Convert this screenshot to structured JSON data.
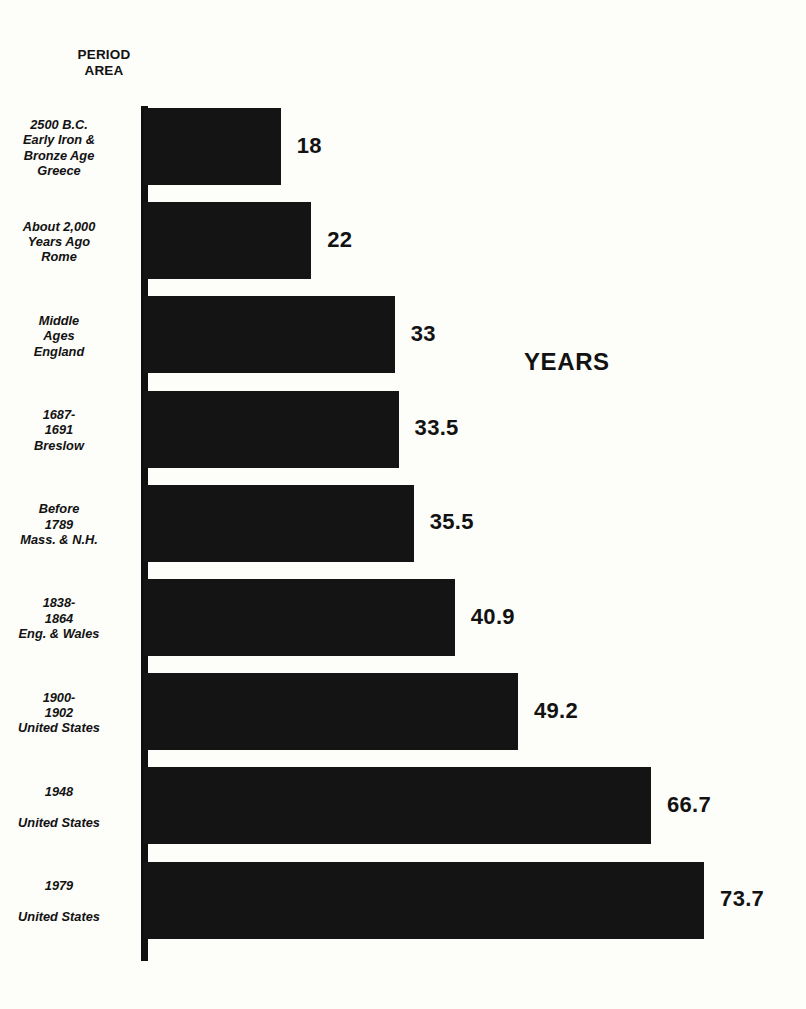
{
  "chart_data": {
    "type": "bar",
    "orientation": "horizontal",
    "title": "",
    "subtitle": "",
    "xlabel": "YEARS",
    "ylabel": "PERIOD\nAREA",
    "axis_header_line1": "PERIOD",
    "axis_header_line2": "AREA",
    "value_caption": "YEARS",
    "grid": false,
    "legend": "none",
    "xlim": [
      0,
      73.7
    ],
    "categories": [
      "2500 B.C.\nEarly Iron &\nBronze Age\nGreece",
      "About 2,000\nYears Ago\nRome",
      "Middle\nAges\nEngland",
      "1687-\n1691\nBreslow",
      "Before\n1789\nMass. & N.H.",
      "1838-\n1864\nEng. & Wales",
      "1900-\n1902\nUnited States",
      "1948\n\nUnited States",
      "1979\n\nUnited States"
    ],
    "values": [
      18,
      22,
      33,
      33.5,
      35.5,
      40.9,
      49.2,
      66.7,
      73.7
    ],
    "value_labels": [
      "18",
      "22",
      "33",
      "33.5",
      "35.5",
      "40.9",
      "49.2",
      "66.7",
      "73.7"
    ],
    "bar_color": "#141414",
    "background_color": "#fdfdfa",
    "text_color": "#121212",
    "bars": [
      {
        "label": "2500 B.C.\nEarly Iron &\nBronze Age\nGreece",
        "value": 18,
        "value_label": "18"
      },
      {
        "label": "About 2,000\nYears Ago\nRome",
        "value": 22,
        "value_label": "22"
      },
      {
        "label": "Middle\nAges\nEngland",
        "value": 33,
        "value_label": "33"
      },
      {
        "label": "1687-\n1691\nBreslow",
        "value": 33.5,
        "value_label": "33.5"
      },
      {
        "label": "Before\n1789\nMass. & N.H.",
        "value": 35.5,
        "value_label": "35.5"
      },
      {
        "label": "1838-\n1864\nEng. & Wales",
        "value": 40.9,
        "value_label": "40.9"
      },
      {
        "label": "1900-\n1902\nUnited States",
        "value": 49.2,
        "value_label": "49.2"
      },
      {
        "label": "1948\n\nUnited States",
        "value": 66.7,
        "value_label": "66.7"
      },
      {
        "label": "1979\n\nUnited States",
        "value": 73.7,
        "value_label": "73.7"
      }
    ]
  },
  "layout": {
    "plot_left_px": 144,
    "plot_top_px": 108,
    "row_pitch_px": 94.2,
    "bar_height_px": 77,
    "px_per_unit": 7.6,
    "value_label_gap_px": 16
  }
}
